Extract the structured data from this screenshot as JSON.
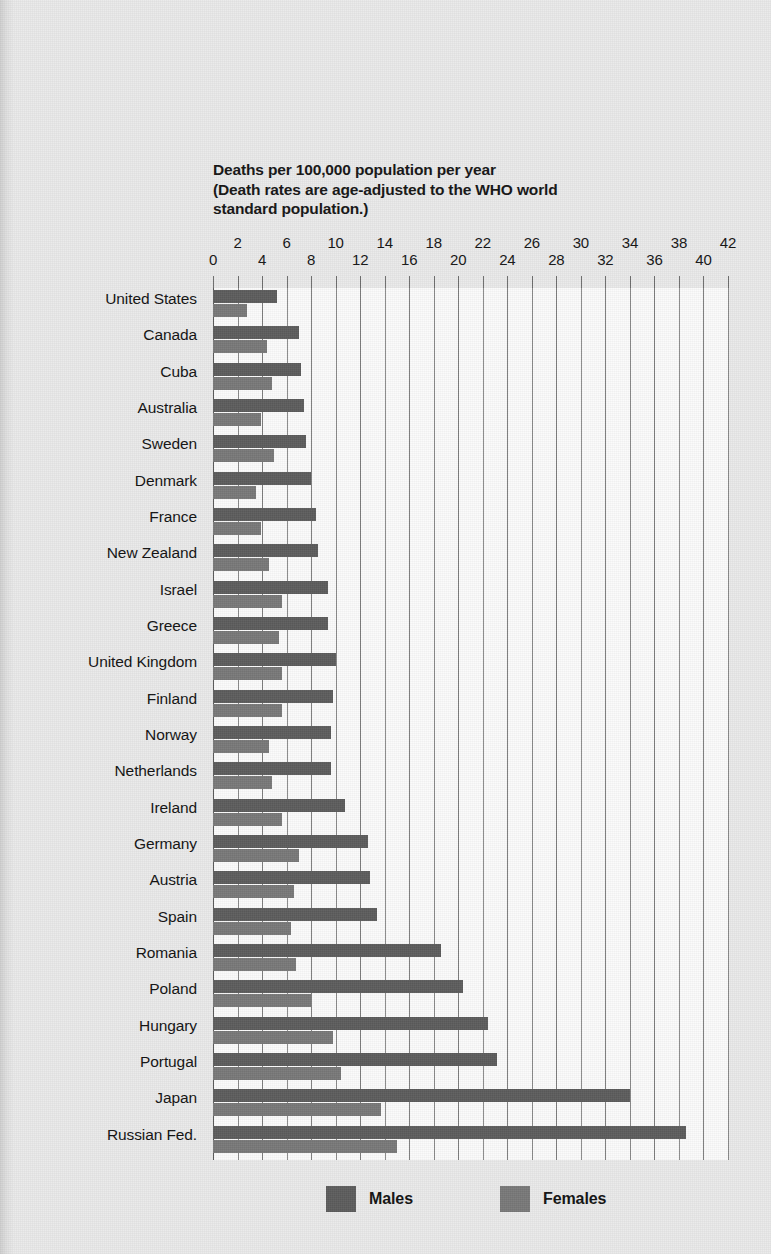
{
  "title": {
    "line1": "Deaths per 100,000 population per year",
    "line2": "(Death rates are age-adjusted to the WHO world",
    "line3": "standard population.)"
  },
  "legend": {
    "males": {
      "label": "Males",
      "color": "#5c5c5c"
    },
    "females": {
      "label": "Females",
      "color": "#787878"
    }
  },
  "axis": {
    "ticks": [
      "0",
      "2",
      "4",
      "6",
      "8",
      "10",
      "12",
      "14",
      "16",
      "18",
      "20",
      "22",
      "24",
      "26",
      "28",
      "30",
      "32",
      "34",
      "36",
      "38",
      "40",
      "42"
    ]
  },
  "chart_data": {
    "type": "bar",
    "orientation": "horizontal",
    "title": "Deaths per 100,000 population per year (Death rates are age-adjusted to the WHO world standard population.)",
    "xlabel": "Deaths per 100,000 population per year",
    "ylabel": "",
    "xlim": [
      0,
      42
    ],
    "xticks": [
      0,
      2,
      4,
      6,
      8,
      10,
      12,
      14,
      16,
      18,
      20,
      22,
      24,
      26,
      28,
      30,
      32,
      34,
      36,
      38,
      40,
      42
    ],
    "grid": true,
    "legend_position": "bottom",
    "categories": [
      "United States",
      "Canada",
      "Cuba",
      "Australia",
      "Sweden",
      "Denmark",
      "France",
      "New Zealand",
      "Israel",
      "Greece",
      "United Kingdom",
      "Finland",
      "Norway",
      "Netherlands",
      "Ireland",
      "Germany",
      "Austria",
      "Spain",
      "Romania",
      "Poland",
      "Hungary",
      "Portugal",
      "Japan",
      "Russian Fed."
    ],
    "series": [
      {
        "name": "Males",
        "color": "#5c5c5c",
        "values": [
          5.2,
          7.0,
          7.2,
          7.4,
          7.6,
          8.0,
          8.4,
          8.6,
          9.4,
          9.4,
          10.0,
          9.8,
          9.6,
          9.6,
          10.8,
          12.6,
          12.8,
          13.4,
          18.6,
          20.4,
          22.4,
          23.2,
          34.0,
          38.6
        ],
        "unit": "deaths per 100,000 per year"
      },
      {
        "name": "Females",
        "color": "#787878",
        "values": [
          2.8,
          4.4,
          4.8,
          3.9,
          5.0,
          3.5,
          3.9,
          4.6,
          5.6,
          5.4,
          5.6,
          5.6,
          4.6,
          4.8,
          5.6,
          7.0,
          6.6,
          6.4,
          6.8,
          8.0,
          9.8,
          10.4,
          13.7,
          15.0
        ],
        "unit": "deaths per 100,000 per year"
      }
    ]
  }
}
